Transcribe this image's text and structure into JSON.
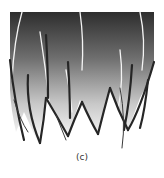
{
  "figure": {
    "caption": "(c)",
    "colors": {
      "gradient_top": "#3a3a3a",
      "gradient_mid": "#8a8a8a",
      "gradient_bottom": "#f0f0f0",
      "strand_dark": "#2a2a2a",
      "strand_light": "#f4f4f4"
    }
  }
}
